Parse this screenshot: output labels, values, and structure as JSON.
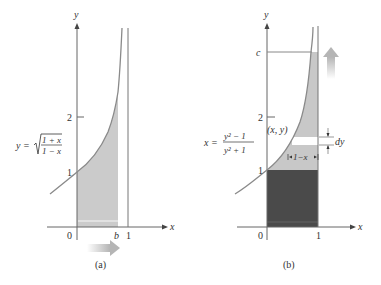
{
  "figure": {
    "panel_a": {
      "caption": "(a)",
      "axis_x_label": "x",
      "axis_y_label": "y",
      "tick_x": [
        "0",
        "b",
        "1"
      ],
      "tick_y": [
        "1",
        "2"
      ],
      "equation_lhs": "y =",
      "equation_num": "1 + x",
      "equation_den": "1 − x",
      "arrow_direction": "right"
    },
    "panel_b": {
      "caption": "(b)",
      "axis_x_label": "x",
      "axis_y_label": "y",
      "tick_x": [
        "0",
        "1"
      ],
      "tick_y": [
        "1",
        "2",
        "c"
      ],
      "equation_lhs": "x =",
      "equation_num": "y² − 1",
      "equation_den": "y² + 1",
      "point_label": "(x, y)",
      "width_label": "1−x",
      "dy_label": "dy",
      "arrow_direction": "up"
    },
    "colors": {
      "curve": "#8a8a8a",
      "axis": "#666666",
      "light_fill": "#c9c9c9",
      "dark_fill": "#4a4a4a",
      "arrow": "#bdbdbd"
    }
  }
}
